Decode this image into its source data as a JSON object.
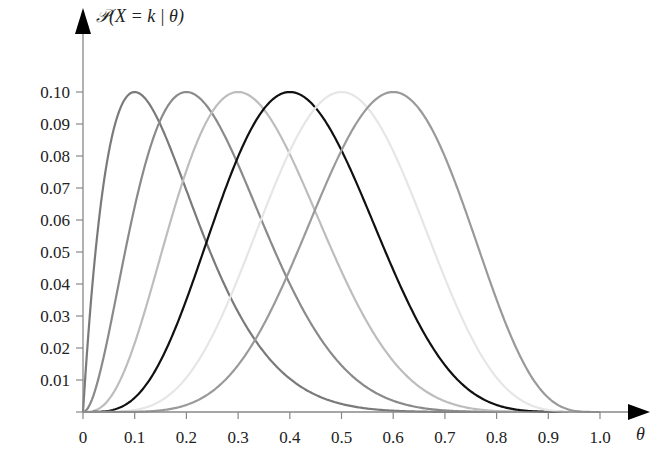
{
  "chart_data": {
    "type": "line",
    "title": "",
    "ylabel": "𝒫(X = k | θ)",
    "xlabel": "θ",
    "xlim": [
      0,
      1.0
    ],
    "ylim": [
      0,
      0.1
    ],
    "grid": false,
    "legend": null,
    "x_ticks": [
      "0",
      "0.1",
      "0.2",
      "0.3",
      "0.4",
      "0.5",
      "0.6",
      "0.7",
      "0.8",
      "0.9",
      "1.0"
    ],
    "y_ticks": [
      "0.01",
      "0.02",
      "0.03",
      "0.04",
      "0.05",
      "0.06",
      "0.07",
      "0.08",
      "0.09",
      "0.10"
    ],
    "series": [
      {
        "name": "k=1 (peak θ=0.1)",
        "peak_x": 0.1,
        "peak_y": 0.1,
        "color": "#7a7a7a"
      },
      {
        "name": "k=2 (peak θ=0.2)",
        "peak_x": 0.2,
        "peak_y": 0.1,
        "color": "#8a8a8a"
      },
      {
        "name": "k=3 (peak θ=0.3)",
        "peak_x": 0.3,
        "peak_y": 0.1,
        "color": "#bdbdbd"
      },
      {
        "name": "k=4 (peak θ=0.4)",
        "peak_x": 0.4,
        "peak_y": 0.1,
        "color": "#111111"
      },
      {
        "name": "k=5 (peak θ=0.5)",
        "peak_x": 0.5,
        "peak_y": 0.1,
        "color": "#e6e6e6"
      },
      {
        "name": "k=6 (peak θ=0.6)",
        "peak_x": 0.6,
        "peak_y": 0.1,
        "color": "#9a9a9a"
      }
    ],
    "n_trials": 10
  }
}
